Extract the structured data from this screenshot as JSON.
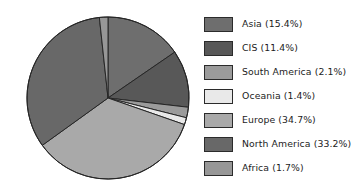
{
  "chart_data": {
    "type": "pie",
    "title": "",
    "subtitle": "",
    "xlabel": "",
    "ylabel": "",
    "grid": false,
    "legend_position": "right",
    "start_angle_deg": 90,
    "direction": "clockwise",
    "center": {
      "x": 108,
      "y": 98
    },
    "radius": 81,
    "total_percent": 99.9,
    "categories": [
      "Asia",
      "CIS",
      "South America",
      "Oceania",
      "Europe",
      "North America",
      "Africa"
    ],
    "values": [
      15.4,
      11.4,
      2.1,
      1.4,
      34.7,
      33.2,
      1.7
    ],
    "labels": [
      "Asia (15.4%)",
      "CIS (11.4%)",
      "South America (2.1%)",
      "Oceania (1.4%)",
      "Europe (34.7%)",
      "North America (33.2%)",
      "Africa (1.7%)"
    ],
    "colors": [
      "#6e6e6e",
      "#585858",
      "#9b9b9b",
      "#e9e9e9",
      "#a9a9a9",
      "#686868",
      "#979797"
    ],
    "edge_color": "#262626",
    "edge_width": 1,
    "slices": [
      {
        "name": "Asia",
        "value": 15.4,
        "label": "Asia (15.4%)",
        "color": "#6e6e6e"
      },
      {
        "name": "CIS",
        "value": 11.4,
        "label": "CIS (11.4%)",
        "color": "#585858"
      },
      {
        "name": "South America",
        "value": 2.1,
        "label": "South America (2.1%)",
        "color": "#9b9b9b"
      },
      {
        "name": "Oceania",
        "value": 1.4,
        "label": "Oceania (1.4%)",
        "color": "#e9e9e9"
      },
      {
        "name": "Europe",
        "value": 34.7,
        "label": "Europe (34.7%)",
        "color": "#a9a9a9"
      },
      {
        "name": "North America",
        "value": 33.2,
        "label": "North America (33.2%)",
        "color": "#686868"
      },
      {
        "name": "Africa",
        "value": 1.7,
        "label": "Africa (1.7%)",
        "color": "#979797"
      }
    ]
  },
  "legend": {
    "items": [
      {
        "label": "Asia (15.4%)",
        "color": "#6e6e6e"
      },
      {
        "label": "CIS (11.4%)",
        "color": "#585858"
      },
      {
        "label": "South America (2.1%)",
        "color": "#9b9b9b"
      },
      {
        "label": "Oceania (1.4%)",
        "color": "#e9e9e9"
      },
      {
        "label": "Europe (34.7%)",
        "color": "#a9a9a9"
      },
      {
        "label": "North America (33.2%)",
        "color": "#686868"
      },
      {
        "label": "Africa (1.7%)",
        "color": "#979797"
      }
    ]
  }
}
